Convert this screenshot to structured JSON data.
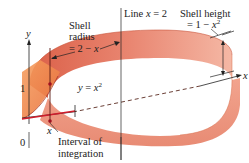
{
  "diagram": {
    "type": "cylindrical-shell-method",
    "labels": {
      "shell_radius_line1": "Shell",
      "shell_radius_line2": "radius",
      "shell_radius_eq_prefix": "= 2 − ",
      "shell_radius_eq_var": "x",
      "line_prefix": "Line ",
      "line_var": "x",
      "line_suffix": " = 2",
      "shell_height_line1": "Shell height",
      "shell_height_eq_prefix": "= 1 − ",
      "shell_height_eq_var": "x",
      "shell_height_exp": "2",
      "curve_prefix": "y",
      "curve_eq": " = ",
      "curve_var": "x",
      "curve_exp": "2",
      "axis_y": "y",
      "axis_x": "x",
      "tick_1": "1",
      "tick_0": "0",
      "point_x": "x",
      "interval_line1": "Interval of",
      "interval_line2": "integration"
    },
    "colors": {
      "shell_outer": "#e8806a",
      "shell_inner": "#f4b8a4",
      "shell_dark": "#d9604a",
      "region": "#f08a4a",
      "interval": "#d01c2c",
      "ink": "#222222"
    }
  }
}
